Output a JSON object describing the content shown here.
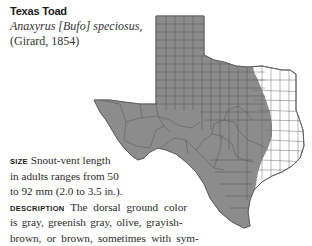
{
  "species": {
    "common_name": "Texas Toad",
    "scientific_name": "Anaxyrus [Bufo] speciosus,",
    "authority": "(Girard, 1854)"
  },
  "map": {
    "description": "Range map of Texas counties; western and central counties shaded gray indicate range",
    "range_color": "#8c8c8c",
    "outside_color": "#ffffff",
    "border_color": "#444444"
  },
  "text": {
    "size_label": "SIZE",
    "size_line1": " Snout-vent length",
    "size_line2": "in adults ranges from 50",
    "size_line3": "to 92 mm (2.0 to 3.5 in.).",
    "desc_label": "DESCRIPTION",
    "desc_line1": " The dorsal ground color",
    "desc_line2": "is gray, greenish gray, olive, grayish-",
    "desc_line3": "brown, or brown, sometimes with sym-"
  }
}
